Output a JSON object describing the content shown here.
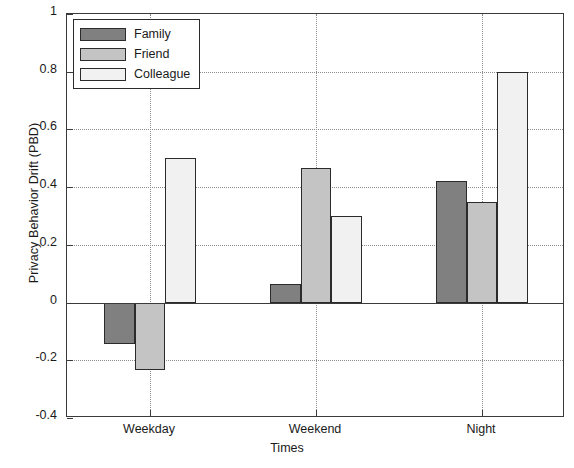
{
  "chart_data": {
    "type": "bar",
    "title": "",
    "xlabel": "Times",
    "ylabel": "Privacy Behavior Drift (PBD)",
    "categories": [
      "Weekday",
      "Weekend",
      "Night"
    ],
    "series": [
      {
        "name": "Family",
        "color": "#808080",
        "values": [
          -0.145,
          0.065,
          0.42
        ]
      },
      {
        "name": "Friend",
        "color": "#c4c4c4",
        "values": [
          -0.235,
          0.465,
          0.35
        ]
      },
      {
        "name": "Colleague",
        "color": "#f1f1f1",
        "values": [
          0.5,
          0.3,
          0.8
        ]
      }
    ],
    "ylim": [
      -0.4,
      1
    ],
    "yticks": [
      1,
      0.8,
      0.6,
      0.4,
      0.2,
      0,
      -0.2,
      -0.4
    ],
    "ytick_labels": [
      "1",
      "0.8",
      "0.6",
      "0.4",
      "0.2",
      "0",
      "-0.2",
      "-0.4"
    ],
    "grid": true,
    "grid_style": "dotted",
    "legend_position": "upper left",
    "axes_color": "#3a3a3a",
    "background": "#ffffff"
  },
  "legend": {
    "entries": [
      {
        "label": "Family"
      },
      {
        "label": "Friend"
      },
      {
        "label": "Colleague"
      }
    ]
  }
}
